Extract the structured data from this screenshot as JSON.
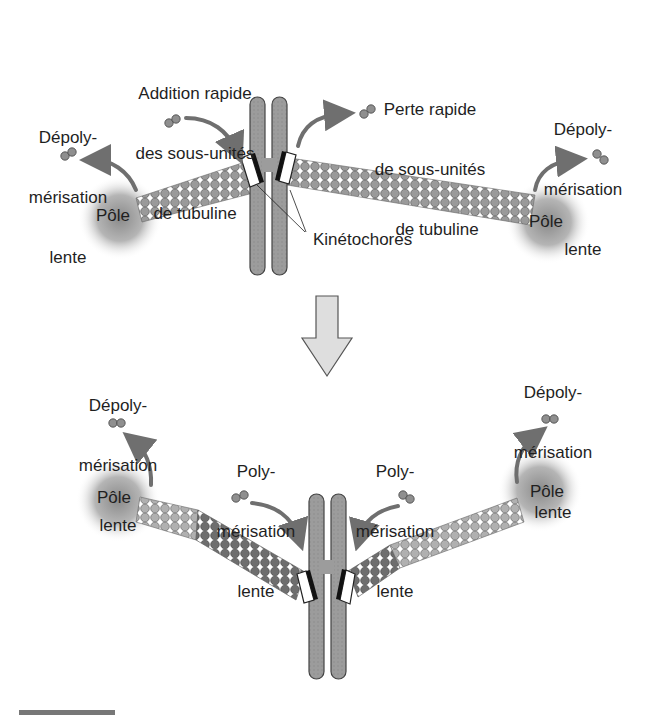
{
  "figure": {
    "top_panel": {
      "left_pole_label": "Pôle",
      "right_pole_label": "Pôle",
      "left_depoly": [
        "Dépoly-",
        "mérisation",
        "lente"
      ],
      "right_depoly": [
        "Dépoly-",
        "mérisation",
        "lente"
      ],
      "addition": [
        "Addition rapide",
        "des sous-unités",
        "de tubuline"
      ],
      "loss": [
        "Perte rapide",
        "de sous-unités",
        "de tubuline"
      ],
      "kinetochores": "Kinétochores"
    },
    "transition_arrow": "down-arrow",
    "bottom_panel": {
      "left_pole_label": "Pôle",
      "right_pole_label": "Pôle",
      "left_depoly": [
        "Dépoly-",
        "mérisation",
        "lente"
      ],
      "right_depoly": [
        "Dépoly-",
        "mérisation",
        "lente"
      ],
      "left_poly": [
        "Poly-",
        "mérisation",
        "lente"
      ],
      "right_poly": [
        "Poly-",
        "mérisation",
        "lente"
      ]
    },
    "colors": {
      "chromosome": "#9a9a9a",
      "subunit": "#8f8f8f",
      "subunit_dark": "#6e6e6e",
      "subunit_light": "#a8a8a8",
      "arrow": "#6f6f6f",
      "big_arrow_fill": "#dedede",
      "pole_glow": "#9c9c9c"
    }
  }
}
